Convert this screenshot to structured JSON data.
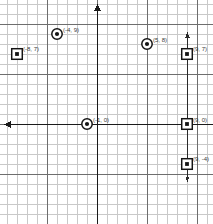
{
  "figure": {
    "type": "coordinate-grid-plot",
    "background_color": "#ffffff",
    "grid": {
      "minor_color": "#c9c9c9",
      "major_color": "#6e6e6e",
      "cell_px": 10,
      "major_every": 5,
      "origin_px": {
        "x": 97,
        "y": 124
      }
    },
    "axes": {
      "x_axis": {
        "label": "x-axis",
        "color": "#1a1a1a",
        "arrow": "left"
      },
      "y_axis": {
        "label": "y-axis",
        "color": "#1a1a1a",
        "arrow": "up"
      }
    },
    "extra_line": {
      "name": "vertical-line-x9",
      "x_value": 9,
      "color": "#2a2a2a",
      "arrows": "both"
    }
  },
  "chart_data": {
    "type": "scatter",
    "title": "",
    "xlabel": "",
    "ylabel": "",
    "xlim": [
      -9,
      11
    ],
    "ylim": [
      -12,
      10
    ],
    "grid": true,
    "legend": "none",
    "points": [
      {
        "label": "(-4, 9)",
        "x": -4,
        "y": 9,
        "marker": "circle",
        "label_dx": 6,
        "label_dy": -7
      },
      {
        "label": "(5, 8)",
        "x": 5,
        "y": 8,
        "marker": "circle",
        "label_dx": 6,
        "label_dy": -7
      },
      {
        "label": "(-8, 7)",
        "x": -8,
        "y": 7,
        "marker": "square",
        "label_dx": 6,
        "label_dy": -8
      },
      {
        "label": "(9, 7)",
        "x": 9,
        "y": 7,
        "marker": "square",
        "label_dx": 6,
        "label_dy": -8
      },
      {
        "label": "(-1, 0)",
        "x": -1,
        "y": 0,
        "marker": "circle",
        "label_dx": 6,
        "label_dy": -7
      },
      {
        "label": "(9, 0)",
        "x": 9,
        "y": 0,
        "marker": "square",
        "label_dx": 6,
        "label_dy": -7
      },
      {
        "label": "(9, -4)",
        "x": 9,
        "y": -4,
        "marker": "square",
        "label_dx": 6,
        "label_dy": -8
      }
    ]
  }
}
